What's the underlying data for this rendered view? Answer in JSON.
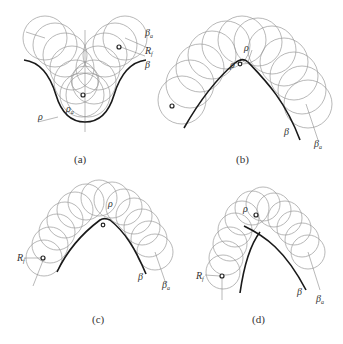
{
  "figure": {
    "panels": [
      {
        "id": "a",
        "caption": "(a)",
        "labels": {
          "beta_a": "β",
          "beta_a_sub": "a",
          "R": "R",
          "R_sub": "f",
          "beta": "β",
          "rho": "ρ",
          "rho_a": "ρ",
          "rho_a_sub": "a"
        }
      },
      {
        "id": "b",
        "caption": "(b)",
        "labels": {
          "R": "R",
          "R_sub": "f",
          "rho_top": "ρ",
          "rho_left": "ρ",
          "beta": "β",
          "beta_a": "β",
          "beta_a_sub": "a"
        }
      },
      {
        "id": "c",
        "caption": "(c)",
        "labels": {
          "R": "R",
          "R_sub": "f",
          "rho": "ρ",
          "beta": "β",
          "beta_a": "β",
          "beta_a_sub": "a"
        }
      },
      {
        "id": "d",
        "caption": "(d)",
        "labels": {
          "R": "R",
          "R_sub": "f",
          "rho": "ρ",
          "beta": "β",
          "beta_a": "β",
          "beta_a_sub": "a"
        }
      }
    ]
  },
  "colors": {
    "curve": "#1a1a1a",
    "circles": "#9a9a9a",
    "text": "#333333"
  }
}
